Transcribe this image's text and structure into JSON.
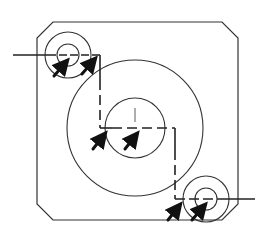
{
  "diagram": {
    "type": "technical-drawing",
    "colors": {
      "background": "#ffffff",
      "stroke": "#222222",
      "arrow": "#111111"
    },
    "plate": {
      "x1": 37,
      "y1": 22,
      "x2": 238,
      "y2": 220,
      "chamfer": 16
    },
    "holes": [
      {
        "id": "top-left",
        "cx": 68,
        "cy": 55,
        "r_inner": 11,
        "r_outer": 23
      },
      {
        "id": "center",
        "cx": 135,
        "cy": 128,
        "r_inner": 30,
        "r_outer": 68
      },
      {
        "id": "bottom-right",
        "cx": 206,
        "cy": 199,
        "r_inner": 11,
        "r_outer": 23
      }
    ],
    "arrows_count": 6
  }
}
